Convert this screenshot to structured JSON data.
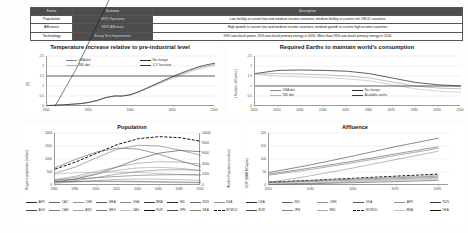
{
  "table": {
    "headers": [
      "Factor",
      "Scenario",
      "Description"
    ],
    "rows": [
      {
        "factor": "Population",
        "scenario": "SSP1 Population",
        "description": "Low fertility in current low and medium income countries, medium fertility in current rich OECD countries"
      },
      {
        "factor": "Affluence",
        "scenario": "SSP2 Affluence",
        "description": "High growth in current low and medium income countries, medium growth in current high income countries"
      },
      {
        "factor": "Technology",
        "scenario": "Strong Tech Improvement",
        "description": "90% non-fossil power, 50% non-fossil primary energy in 2050. More than 90% non-fossil primary energy in 2100"
      }
    ]
  },
  "chart_data": [
    {
      "id": "temperature",
      "type": "line",
      "title": "Temperature increase relative to pre-industrial level",
      "xlabel": "",
      "ylabel": "[C]",
      "xlim": [
        1900,
        2100
      ],
      "ylim": [
        0,
        2.5
      ],
      "xticks": [
        "1900",
        "1950",
        "2000",
        "2050",
        "2100"
      ],
      "xtick_values": [
        1900,
        1950,
        2000,
        2050,
        2100
      ],
      "yticks": [
        "0",
        "0,5",
        "1",
        "1,5",
        "2",
        "2,5"
      ],
      "ytick_values": [
        0,
        0.5,
        1,
        1.5,
        2,
        2.5
      ],
      "grid": true,
      "legend_position": "top-inside",
      "legend": [
        "USA diet",
        "No change",
        "IND diet",
        "1,5° Increase"
      ],
      "series": [
        {
          "name": "USA diet",
          "x": [
            1900,
            1920,
            1940,
            1950,
            1960,
            1970,
            1980,
            1990,
            2000,
            2010,
            2020,
            2030,
            2040,
            2050,
            2060,
            2070,
            2080,
            2090,
            2100
          ],
          "values": [
            0.02,
            0.06,
            0.12,
            0.18,
            0.28,
            0.42,
            0.5,
            0.5,
            0.56,
            0.72,
            0.9,
            1.08,
            1.26,
            1.44,
            1.6,
            1.76,
            1.9,
            2.0,
            2.08
          ]
        },
        {
          "name": "IND diet",
          "x": [
            1900,
            1920,
            1940,
            1950,
            1960,
            1970,
            1980,
            1990,
            2000,
            2010,
            2020,
            2030,
            2040,
            2050,
            2060,
            2070,
            2080,
            2090,
            2100
          ],
          "values": [
            0.02,
            0.06,
            0.12,
            0.18,
            0.28,
            0.42,
            0.5,
            0.5,
            0.56,
            0.71,
            0.88,
            1.05,
            1.22,
            1.39,
            1.55,
            1.7,
            1.84,
            1.94,
            2.02
          ]
        },
        {
          "name": "No change",
          "x": [
            1900,
            1920,
            1940,
            1950,
            1960,
            1970,
            1980,
            1990,
            2000,
            2010,
            2020,
            2030,
            2040,
            2050,
            2060,
            2070,
            2080,
            2090,
            2100
          ],
          "values": [
            0.02,
            0.06,
            0.12,
            0.18,
            0.28,
            0.42,
            0.5,
            0.5,
            0.57,
            0.73,
            0.92,
            1.11,
            1.3,
            1.48,
            1.65,
            1.81,
            1.95,
            2.06,
            2.14
          ]
        },
        {
          "name": "1,5° Increase",
          "x": [
            1900,
            2100
          ],
          "values": [
            1.5,
            1.5
          ]
        }
      ]
    },
    {
      "id": "earths",
      "type": "line",
      "title": "Required Earths to maintain world's consumption",
      "xlabel": "",
      "ylabel": "[ Number of Earths ]",
      "xlim": [
        2010,
        2100
      ],
      "ylim": [
        0,
        2.5
      ],
      "xticks": [
        "2010",
        "2020",
        "2030",
        "2040",
        "2050",
        "2060",
        "2070",
        "2080",
        "2090",
        "2100"
      ],
      "xtick_values": [
        2010,
        2020,
        2030,
        2040,
        2050,
        2060,
        2070,
        2080,
        2090,
        2100
      ],
      "yticks": [
        "0",
        "0,5",
        "1",
        "1,5",
        "2",
        "2,5"
      ],
      "ytick_values": [
        0,
        0.5,
        1,
        1.5,
        2,
        2.5
      ],
      "grid": true,
      "legend_position": "bottom-inside",
      "legend": [
        "USA diet",
        "No change",
        "IND diet",
        "Available earths"
      ],
      "series": [
        {
          "name": "No change",
          "x": [
            2010,
            2020,
            2030,
            2040,
            2050,
            2060,
            2070,
            2080,
            2090,
            2100
          ],
          "values": [
            1.62,
            1.78,
            1.8,
            1.78,
            1.74,
            1.62,
            1.4,
            1.18,
            1.06,
            1.0
          ]
        },
        {
          "name": "USA diet",
          "x": [
            2010,
            2020,
            2030,
            2040,
            2050,
            2060,
            2070,
            2080,
            2090,
            2100
          ],
          "values": [
            1.6,
            1.62,
            1.6,
            1.56,
            1.5,
            1.4,
            1.2,
            1.0,
            0.9,
            0.86
          ]
        },
        {
          "name": "IND diet",
          "x": [
            2010,
            2020,
            2030,
            2040,
            2050,
            2060,
            2070,
            2080,
            2090,
            2100
          ],
          "values": [
            1.58,
            1.5,
            1.46,
            1.42,
            1.36,
            1.26,
            1.06,
            0.86,
            0.74,
            0.68
          ]
        },
        {
          "name": "Available earths",
          "x": [
            2010,
            2100
          ],
          "values": [
            1.0,
            1.0
          ]
        }
      ]
    },
    {
      "id": "population",
      "type": "line",
      "title": "Population",
      "xlabel": "",
      "ylabel": "Region's population (million)",
      "ylabel_right": "World's Population (million)",
      "xlim": [
        1960,
        2100
      ],
      "ylim": [
        0,
        2000
      ],
      "ylim_right": [
        0,
        10000
      ],
      "xticks": [
        "1960",
        "1980",
        "2000",
        "2020",
        "2040",
        "2060",
        "2080",
        "2100"
      ],
      "xtick_values": [
        1960,
        1980,
        2000,
        2020,
        2040,
        2060,
        2080,
        2100
      ],
      "yticks": [
        "0",
        "500",
        "1000",
        "1500",
        "2000"
      ],
      "ytick_values": [
        0,
        500,
        1000,
        1500,
        2000
      ],
      "yticks_right": [
        "0",
        "2000",
        "4000",
        "6000",
        "8000",
        "10000"
      ],
      "ytick_right_values": [
        0,
        2000,
        4000,
        6000,
        8000,
        10000
      ],
      "grid": true,
      "legend_position": "bottom",
      "legend": [
        "AFR",
        "AUS",
        "CAC",
        "CAN",
        "CHN",
        "ANZ",
        "MEA",
        "MEX",
        "USA",
        "OAS",
        "BRA",
        "EUR",
        "IND",
        "JPN",
        "RUS",
        "SEA",
        "SSA",
        "WORLD"
      ],
      "series": [
        {
          "name": "AFR",
          "x": [
            1960,
            1980,
            2000,
            2020,
            2040,
            2060,
            2080,
            2100
          ],
          "values": [
            120,
            230,
            420,
            700,
            1000,
            1230,
            1330,
            1280
          ]
        },
        {
          "name": "CHN",
          "x": [
            1960,
            1980,
            2000,
            2020,
            2040,
            2060,
            2080,
            2100
          ],
          "values": [
            660,
            990,
            1270,
            1420,
            1380,
            1180,
            930,
            700
          ]
        },
        {
          "name": "IND",
          "x": [
            1960,
            1980,
            2000,
            2020,
            2040,
            2060,
            2080,
            2100
          ],
          "values": [
            450,
            700,
            1050,
            1380,
            1530,
            1500,
            1340,
            1140
          ]
        },
        {
          "name": "OAS",
          "x": [
            1960,
            1980,
            2000,
            2020,
            2040,
            2060,
            2080,
            2100
          ],
          "values": [
            210,
            340,
            520,
            700,
            840,
            900,
            880,
            800
          ]
        },
        {
          "name": "SEA",
          "x": [
            1960,
            1980,
            2000,
            2020,
            2040,
            2060,
            2080,
            2100
          ],
          "values": [
            190,
            290,
            430,
            570,
            660,
            680,
            640,
            560
          ]
        },
        {
          "name": "EUR",
          "x": [
            1960,
            1980,
            2000,
            2020,
            2040,
            2060,
            2080,
            2100
          ],
          "values": [
            420,
            470,
            490,
            500,
            480,
            440,
            400,
            360
          ]
        },
        {
          "name": "USA",
          "x": [
            1960,
            1980,
            2000,
            2020,
            2040,
            2060,
            2080,
            2100
          ],
          "values": [
            180,
            230,
            280,
            330,
            370,
            390,
            400,
            400
          ]
        },
        {
          "name": "MEA",
          "x": [
            1960,
            1980,
            2000,
            2020,
            2040,
            2060,
            2080,
            2100
          ],
          "values": [
            100,
            170,
            290,
            420,
            520,
            580,
            590,
            560
          ]
        },
        {
          "name": "BRA",
          "x": [
            1960,
            1980,
            2000,
            2020,
            2040,
            2060,
            2080,
            2100
          ],
          "values": [
            72,
            120,
            175,
            215,
            230,
            225,
            205,
            180
          ]
        },
        {
          "name": "JPN",
          "x": [
            1960,
            1980,
            2000,
            2020,
            2040,
            2060,
            2080,
            2100
          ],
          "values": [
            94,
            117,
            127,
            126,
            113,
            98,
            84,
            72
          ]
        },
        {
          "name": "RUS",
          "x": [
            1960,
            1980,
            2000,
            2020,
            2040,
            2060,
            2080,
            2100
          ],
          "values": [
            120,
            139,
            147,
            144,
            136,
            125,
            113,
            100
          ]
        },
        {
          "name": "WORLD",
          "x": [
            1960,
            1980,
            2000,
            2020,
            2040,
            2060,
            2080,
            2100
          ],
          "values": [
            3030,
            4440,
            6120,
            7800,
            8900,
            9300,
            9100,
            8400
          ]
        }
      ]
    },
    {
      "id": "affluence",
      "type": "line",
      "title": "Affluence",
      "xlabel": "",
      "ylabel": "GDP (1000 $/Capita)",
      "xlim": [
        2010,
        2095
      ],
      "ylim": [
        0,
        200
      ],
      "xticks": [
        "2010",
        "2030",
        "2050",
        "2070",
        "2090"
      ],
      "xtick_values": [
        2010,
        2030,
        2050,
        2070,
        2090
      ],
      "yticks": [
        "0",
        "50",
        "100",
        "150",
        "200"
      ],
      "ytick_values": [
        0,
        50,
        100,
        150,
        200
      ],
      "grid": true,
      "legend_position": "bottom",
      "legend": [
        "USA",
        "EUR",
        "IND",
        "JPN",
        "CHN",
        "MID",
        "USA",
        "WORLD",
        "AFR",
        "BRA",
        "RUS",
        "SEA"
      ],
      "series": [
        {
          "name": "USA",
          "x": [
            2010,
            2030,
            2050,
            2070,
            2090
          ],
          "values": [
            48,
            78,
            112,
            148,
            180
          ]
        },
        {
          "name": "JPN",
          "x": [
            2010,
            2030,
            2050,
            2070,
            2090
          ],
          "values": [
            42,
            66,
            92,
            120,
            147
          ]
        },
        {
          "name": "EUR",
          "x": [
            2010,
            2030,
            2050,
            2070,
            2090
          ],
          "values": [
            38,
            60,
            86,
            114,
            141
          ]
        },
        {
          "name": "CHN",
          "x": [
            2010,
            2030,
            2050,
            2070,
            2090
          ],
          "values": [
            10,
            36,
            66,
            98,
            130
          ]
        },
        {
          "name": "WORLD",
          "x": [
            2010,
            2030,
            2050,
            2070,
            2090
          ],
          "values": [
            11,
            18,
            26,
            34,
            42
          ]
        },
        {
          "name": "BRA",
          "x": [
            2010,
            2030,
            2050,
            2070,
            2090
          ],
          "values": [
            11,
            17,
            24,
            31,
            38
          ]
        },
        {
          "name": "RUS",
          "x": [
            2010,
            2030,
            2050,
            2070,
            2090
          ],
          "values": [
            10,
            16,
            22,
            28,
            34
          ]
        },
        {
          "name": "MID",
          "x": [
            2010,
            2030,
            2050,
            2070,
            2090
          ],
          "values": [
            8,
            13,
            18,
            24,
            30
          ]
        },
        {
          "name": "IND",
          "x": [
            2010,
            2030,
            2050,
            2070,
            2090
          ],
          "values": [
            3,
            8,
            14,
            20,
            26
          ]
        },
        {
          "name": "SEA",
          "x": [
            2010,
            2030,
            2050,
            2070,
            2090
          ],
          "values": [
            3,
            7,
            12,
            17,
            22
          ]
        },
        {
          "name": "AFR",
          "x": [
            2010,
            2030,
            2050,
            2070,
            2090
          ],
          "values": [
            2,
            5,
            9,
            13,
            18
          ]
        }
      ]
    }
  ]
}
